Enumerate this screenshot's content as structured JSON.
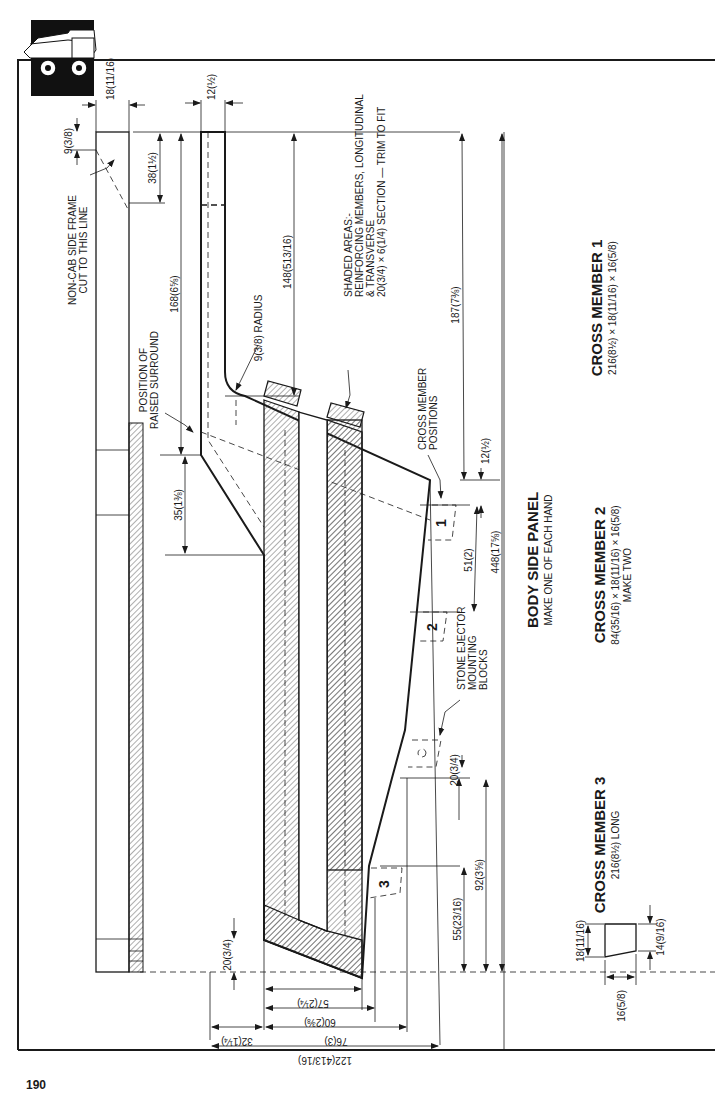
{
  "page": {
    "number": "190"
  },
  "panel": {
    "title": "BODY SIDE PANEL",
    "subtitle": "MAKE ONE OF EACH HAND"
  },
  "cross_members": [
    {
      "title": "CROSS MEMBER 1",
      "spec": "216(8½) × 18(11/16) × 16(5/8)",
      "note": ""
    },
    {
      "title": "CROSS MEMBER 2",
      "spec": "84(35/16) × 18(11/16) × 16(5/8)",
      "note": "MAKE TWO"
    },
    {
      "title": "CROSS MEMBER 3",
      "spec": "216(8½) LONG",
      "note": ""
    }
  ],
  "notes": {
    "non_cab_1": "NON-CAB SIDE FRAME",
    "non_cab_2": "CUT TO THIS LINE",
    "raised_1": "POSITION OF",
    "raised_2": "RAISED SURROUND",
    "radius": "9(3/8) RADIUS",
    "shaded_1": "SHADED AREAS:-",
    "shaded_2": "REINFORCING MEMBERS, LONGITUDINAL",
    "shaded_3": "& TRANSVERSE",
    "shaded_4": "20(3/4) × 6(1/4) SECTION — TRIM TO FIT",
    "cm_pos_1": "CROSS MEMBER",
    "cm_pos_2": "POSITIONS",
    "ejector_1": "STONE EJECTOR",
    "ejector_2": "MOUNTING",
    "ejector_3": "BLOCKS"
  },
  "markers": {
    "m1": "1",
    "m2": "2",
    "m3": "3"
  },
  "dimensions": {
    "d18_top": "18(11/16)",
    "d12_top": "12(½)",
    "d9": "9(3/8)",
    "d38": "38(1½)",
    "d168": "168(6⅝)",
    "d148": "148(513/16)",
    "d187": "187(7⅜)",
    "d35": "35(1⅜)",
    "d12_right": "12(½)",
    "d51": "51(2)",
    "d448": "448(17⅝)",
    "d20_right": "20(3/4)",
    "d92": "92(3⅝)",
    "d55": "55(23/16)",
    "d20_left": "20(3/4)",
    "d57": "57(2¼)",
    "d60": "60(2⅜)",
    "d76": "76(3)",
    "d32": "32(1¼)",
    "d122": "122(413/16)",
    "cs_18": "18(11/16)",
    "cs_16": "16(5/8)",
    "cs_14": "14(9/16)"
  },
  "icons": {
    "logo": "dump-truck-icon"
  }
}
